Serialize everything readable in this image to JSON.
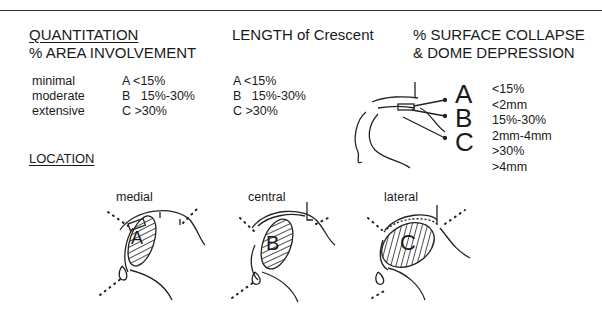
{
  "headers": {
    "quantitation": "QUANTITATION",
    "area_involvement": "% AREA INVOLVEMENT",
    "length": "LENGTH of Crescent",
    "collapse_line1": "% SURFACE COLLAPSE",
    "collapse_line2": "& DOME DEPRESSION",
    "location": "LOCATION"
  },
  "area": {
    "labels": [
      "minimal",
      "moderate",
      "extensive"
    ],
    "values": [
      "A <15%",
      "B   15%-30%",
      "C >30%"
    ]
  },
  "length": {
    "values": [
      "A <15%",
      "B   15%-30%",
      "C >30%"
    ]
  },
  "collapse": {
    "letters": [
      "A",
      "B",
      "C"
    ],
    "values": [
      "<15%",
      "<2mm",
      "15%-30%",
      "2mm-4mm",
      ">30%",
      ">4mm"
    ]
  },
  "location": {
    "labels": [
      "medial",
      "central",
      "lateral"
    ],
    "letters": [
      "A",
      "B",
      "C"
    ]
  }
}
